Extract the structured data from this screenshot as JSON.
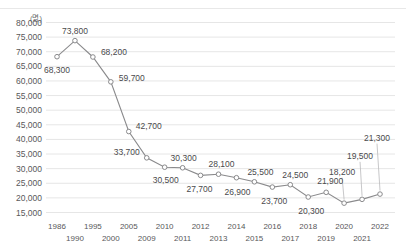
{
  "header": {
    "title_partial": "",
    "cut_off": true
  },
  "axis": {
    "unit_label": "(명)",
    "y_ticks": [
      "80,000",
      "75,000",
      "70,000",
      "65,000",
      "60,000",
      "55,000",
      "50,000",
      "45,000",
      "40,000",
      "35,000",
      "30,000",
      "25,000",
      "20,000",
      "15,000"
    ],
    "x_ticks_top": [
      "1986",
      "1995",
      "2005",
      "2010",
      "2012",
      "2014",
      "2016",
      "2018",
      "2020",
      "2022"
    ],
    "x_ticks_bottom": [
      "1990",
      "2000",
      "2009",
      "2011",
      "2013",
      "2015",
      "2017",
      "2019",
      "2021"
    ]
  },
  "colors": {
    "line": "#8a8a8c",
    "marker_stroke": "#8a8a8c",
    "marker_fill": "#ffffff",
    "grid": "#e6e6e6",
    "text": "#58585a",
    "background": "#ffffff"
  },
  "chart_data": {
    "type": "line",
    "title": "",
    "xlabel": "",
    "ylabel": "(명)",
    "ylim": [
      15000,
      80000
    ],
    "ytick_step": 5000,
    "grid": true,
    "legend": "none",
    "categories": [
      "1986",
      "1990",
      "1995",
      "2000",
      "2005",
      "2009",
      "2010",
      "2011",
      "2012",
      "2013",
      "2014",
      "2015",
      "2016",
      "2017",
      "2018",
      "2019",
      "2020",
      "2021",
      "2022"
    ],
    "x": [
      "1986",
      "1990",
      "1995",
      "2000",
      "2005",
      "2009",
      "2010",
      "2011",
      "2012",
      "2013",
      "2014",
      "2015",
      "2016",
      "2017",
      "2018",
      "2019",
      "2020",
      "2021",
      "2022"
    ],
    "values": [
      68300,
      73800,
      68200,
      59700,
      42700,
      33700,
      30500,
      30300,
      27700,
      28100,
      26900,
      25500,
      23700,
      24500,
      20300,
      21900,
      18200,
      19500,
      21300
    ],
    "point_labels": [
      "68,300",
      "73,800",
      "68,200",
      "59,700",
      "42,700",
      "33,700",
      "30,500",
      "30,300",
      "27,700",
      "28,100",
      "26,900",
      "25,500",
      "23,700",
      "24,500",
      "20,300",
      "21,900",
      "18,200",
      "19,500",
      "21,300"
    ]
  }
}
